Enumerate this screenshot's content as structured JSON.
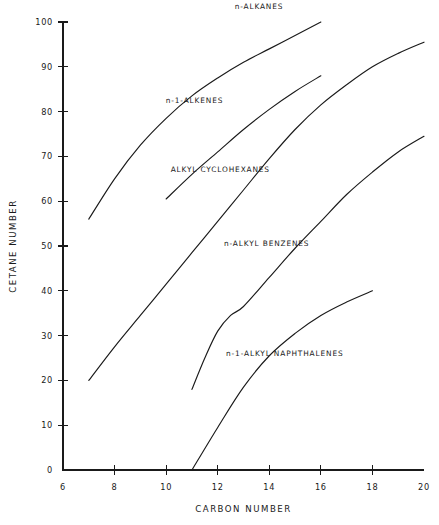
{
  "chart_data": {
    "type": "line",
    "title": "",
    "xlabel": "CARBON NUMBER",
    "ylabel": "CETANE NUMBER",
    "xlim": [
      6,
      20
    ],
    "ylim": [
      0,
      100
    ],
    "xticks": [
      6,
      8,
      10,
      12,
      14,
      16,
      18,
      20
    ],
    "yticks": [
      0,
      10,
      20,
      30,
      40,
      50,
      60,
      70,
      80,
      90,
      100
    ],
    "grid": false,
    "legend": "inline-annotations",
    "series": [
      {
        "name": "n-ALKANES",
        "label_x": 13.6,
        "label_y": 103.0,
        "x": [
          7,
          8,
          9,
          10,
          11,
          12,
          13,
          14,
          15,
          16
        ],
        "y": [
          56,
          65,
          72.5,
          78.5,
          83.5,
          87.5,
          91,
          94,
          97,
          100
        ]
      },
      {
        "name": "n-1-ALKENES",
        "label_x": 11.1,
        "label_y": 82.0,
        "x": [
          10,
          11,
          12,
          13,
          14,
          15,
          16
        ],
        "y": [
          60.5,
          66,
          71,
          76,
          80.5,
          84.5,
          88
        ]
      },
      {
        "name": "ALKYL CYCLOHEXANES",
        "label_x": 12.1,
        "label_y": 66.5,
        "x": [
          7,
          8,
          9,
          10,
          11,
          12,
          13,
          14,
          15,
          16,
          17,
          18,
          19,
          20
        ],
        "y": [
          20,
          27.5,
          34.5,
          41.5,
          48.5,
          55.5,
          62.5,
          69.5,
          76,
          81.5,
          86,
          90,
          93,
          95.5
        ]
      },
      {
        "name": "n-ALKYL BENZENES",
        "label_x": 13.9,
        "label_y": 50.0,
        "x": [
          11,
          11.5,
          12,
          12.5,
          13,
          14,
          15,
          16,
          17,
          18,
          19,
          20
        ],
        "y": [
          18,
          25,
          31,
          34.5,
          36.5,
          43,
          49.5,
          55.5,
          61.5,
          66.5,
          71,
          74.5
        ]
      },
      {
        "name": "n-1-ALKYL NAPHTHALENES",
        "label_x": 14.6,
        "label_y": 25.5,
        "x": [
          11,
          12,
          13,
          14,
          15,
          16,
          17,
          18
        ],
        "y": [
          0,
          9.5,
          18.5,
          25.5,
          30.5,
          34.5,
          37.5,
          40
        ]
      }
    ]
  }
}
